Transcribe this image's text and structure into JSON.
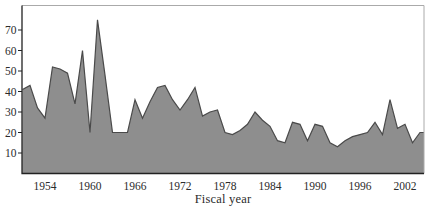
{
  "chart_data": {
    "type": "area",
    "title": "",
    "xlabel": "Fiscal year",
    "ylabel": "",
    "grid": false,
    "legend": "none",
    "xlim": [
      1951,
      2004.6
    ],
    "ylim": [
      0,
      82
    ],
    "y_ticks": [
      10,
      20,
      30,
      40,
      50,
      60,
      70
    ],
    "x_tick_labels": [
      "1954",
      "1960",
      "1966",
      "1972",
      "1978",
      "1984",
      "1990",
      "1996",
      "2002"
    ],
    "years": [
      1951,
      1952,
      1953,
      1954,
      1955,
      1956,
      1957,
      1958,
      1959,
      1960,
      1961,
      1962,
      1963,
      1964,
      1965,
      1966,
      1967,
      1968,
      1969,
      1970,
      1971,
      1972,
      1973,
      1974,
      1975,
      1976,
      1977,
      1978,
      1979,
      1980,
      1981,
      1982,
      1983,
      1984,
      1985,
      1986,
      1987,
      1988,
      1989,
      1990,
      1991,
      1992,
      1993,
      1994,
      1995,
      1996,
      1997,
      1998,
      1999,
      2000,
      2001,
      2002,
      2003,
      2004
    ],
    "values": [
      41,
      43,
      32,
      27,
      52,
      51,
      49,
      34,
      60,
      20,
      75,
      48,
      20,
      20,
      20,
      36,
      27,
      35,
      42,
      43,
      36,
      31,
      36,
      42,
      28,
      30,
      31,
      20,
      19,
      21,
      24,
      30,
      26,
      23,
      16,
      15,
      25,
      24,
      16,
      24,
      23,
      15,
      13,
      16,
      18,
      19,
      20,
      25,
      19,
      36,
      22,
      24,
      15,
      20
    ],
    "colors": {
      "area_fill": "#8e8e8e",
      "area_line": "#4a4a4a",
      "axis": "#222222",
      "frame": "#aaaaaa",
      "text": "#2b2b2b",
      "background": "#ffffff"
    }
  }
}
